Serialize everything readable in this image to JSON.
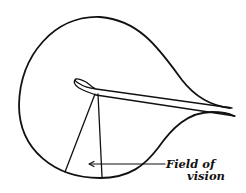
{
  "diagram": {
    "labels": {
      "field_of_vision_line1": "Field of",
      "field_of_vision_line2": "vision"
    },
    "colors": {
      "ink": "#111111",
      "background": "#ffffff"
    }
  }
}
